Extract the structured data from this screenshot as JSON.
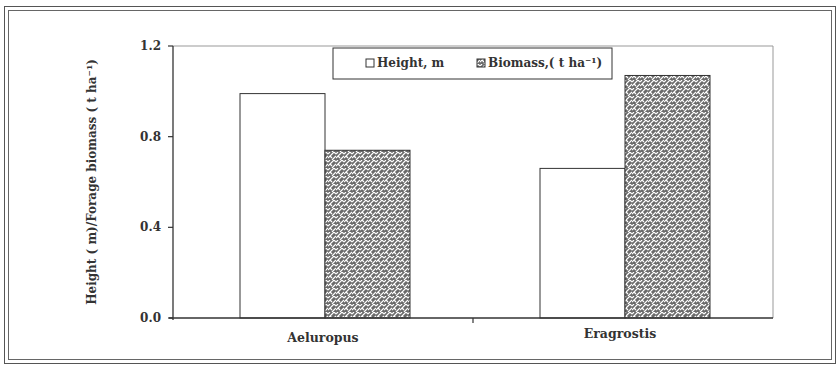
{
  "chart_data": {
    "type": "bar",
    "title": "",
    "xlabel": "",
    "ylabel": "Height ( m)/Forage biomass ( t ha⁻¹)",
    "categories": [
      "Aeluropus",
      "Eragrostis"
    ],
    "series": [
      {
        "name": "Height, m",
        "values": [
          0.99,
          0.66
        ],
        "fill": "plain-white"
      },
      {
        "name": "Biomass, ( t ha⁻¹)",
        "values": [
          0.74,
          1.07
        ],
        "fill": "hatched-gray"
      }
    ],
    "ylim": [
      0,
      1.2
    ],
    "yticks": [
      "0.0",
      "0.4",
      "0.8",
      "1.2"
    ],
    "ytick_values": [
      0,
      0.4,
      0.8,
      1.2
    ],
    "grid": false,
    "legend_position": "top-inside"
  },
  "legend": {
    "height_label": "Height, m",
    "biomass_label": "Biomass,( t ha⁻¹)"
  },
  "axis": {
    "y_title": "Height ( m)/Forage biomass ( t ha⁻¹)"
  },
  "colors": {
    "axis": "#333333",
    "bar_outline": "#333333",
    "hatch_dark": "#5a5a5a",
    "hatch_light": "#ffffff"
  }
}
